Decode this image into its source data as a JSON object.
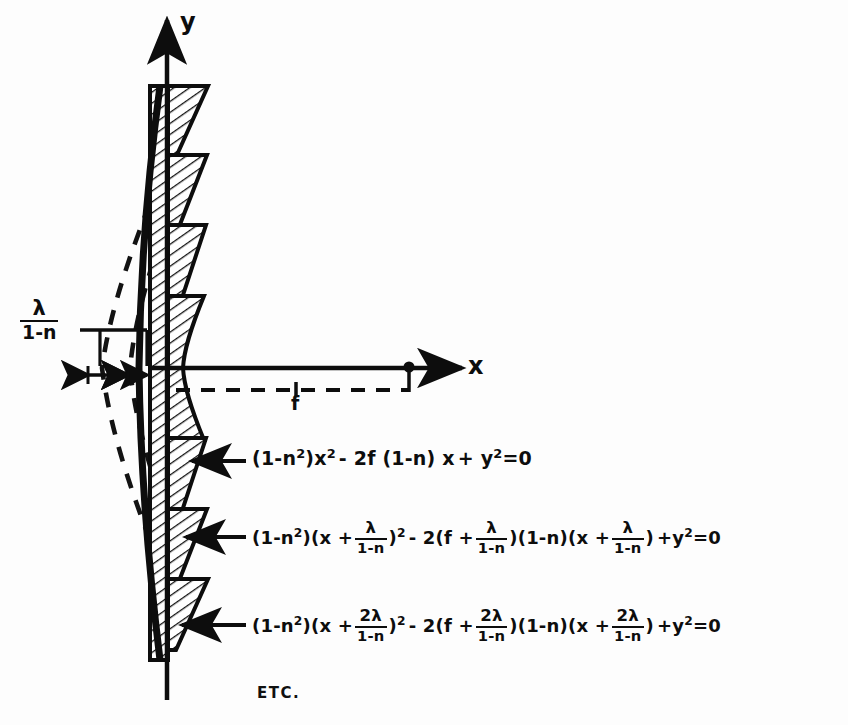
{
  "figure": {
    "type": "technical-diagram",
    "axes": {
      "y_label": "y",
      "x_label": "x",
      "origin_label": ""
    },
    "dimensions": [
      {
        "name": "groove-offset",
        "label_numerator": "λ",
        "label_denominator": "1-n"
      },
      {
        "name": "focal-length",
        "label": "f"
      }
    ],
    "equations": [
      {
        "id": "eq1",
        "text": "(1-n²)x² - 2f(1-n)x + y²=0",
        "parts": {
          "a_open": "(",
          "a_one": "1-n",
          "a_sup": "2",
          "a_close": ")",
          "x_sq": "x",
          "x_sup": "2",
          "b_minus": "- 2f (",
          "b_one": "1-n",
          "b_close": ") x",
          "tail_plus": "+ y",
          "tail_sup": "2",
          "tail_eq": "=0"
        }
      },
      {
        "id": "eq2",
        "text": "(1-n²)(x + λ/(1-n))² - 2(f + λ/(1-n))(1-n)(x + λ/(1-n)) + y²=0",
        "shift_numerator": "λ",
        "shift_denominator": "1-n"
      },
      {
        "id": "eq3",
        "text": "(1-n²)(x + 2λ/(1-n))² - 2(f + 2λ/(1-n))(1-n)(x + 2λ/(1-n)) + y²=0",
        "shift_numerator": "2λ",
        "shift_denominator": "1-n"
      }
    ],
    "etc_label": "ETC.",
    "tokens": {
      "open_paren": "(",
      "close_paren": ")",
      "one_minus_n": "1-n",
      "two": "2",
      "x": "x",
      "y": "y",
      "f": "f",
      "lambda": "λ",
      "two_lambda": "2λ",
      "minus_2": "- 2",
      "plus": "+",
      "eq_zero": "=0",
      "x_plus": "x +",
      "f_plus": "f +"
    },
    "colors": {
      "ink": "#0d0d0d",
      "paper": "#fdfdfd",
      "hatch": "#111111"
    }
  }
}
